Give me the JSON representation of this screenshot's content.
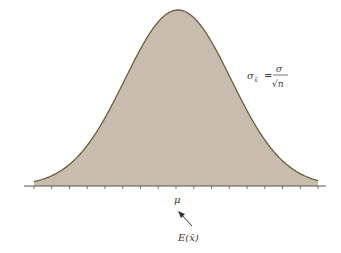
{
  "chart_data": {
    "type": "area",
    "title": "",
    "curve": {
      "distribution": "normal",
      "mean_label": "μ",
      "fill": "#c6bdae",
      "stroke": "#6e5a3c"
    },
    "annotations": {
      "formula_lhs": "σ",
      "formula_sub": "x̄",
      "formula_eq": "=",
      "formula_num": "σ",
      "formula_den": "√n",
      "mean_label": "μ",
      "expected_label": "E(x̄)"
    },
    "axis": {
      "ticks": 17,
      "tick_labels": [
        "μ"
      ],
      "grid": false
    }
  },
  "colors": {
    "fill": "#c6bdae",
    "stroke": "#6e5a3c",
    "axis": "#555555",
    "text": "#3a3a3a"
  }
}
